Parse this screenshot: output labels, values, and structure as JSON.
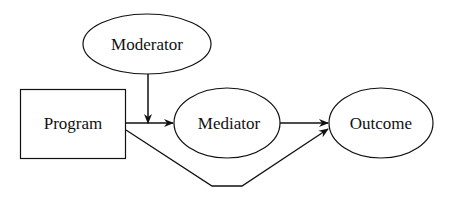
{
  "diagram": {
    "nodes": {
      "moderator": {
        "label": "Moderator",
        "shape": "ellipse"
      },
      "program": {
        "label": "Program",
        "shape": "rectangle"
      },
      "mediator": {
        "label": "Mediator",
        "shape": "ellipse"
      },
      "outcome": {
        "label": "Outcome",
        "shape": "ellipse"
      }
    },
    "edges": [
      {
        "from": "program",
        "to": "mediator"
      },
      {
        "from": "moderator",
        "to": "program-mediator-path"
      },
      {
        "from": "mediator",
        "to": "outcome"
      },
      {
        "from": "program",
        "to": "outcome"
      }
    ],
    "colors": {
      "stroke": "#111111",
      "background": "#ffffff"
    }
  }
}
